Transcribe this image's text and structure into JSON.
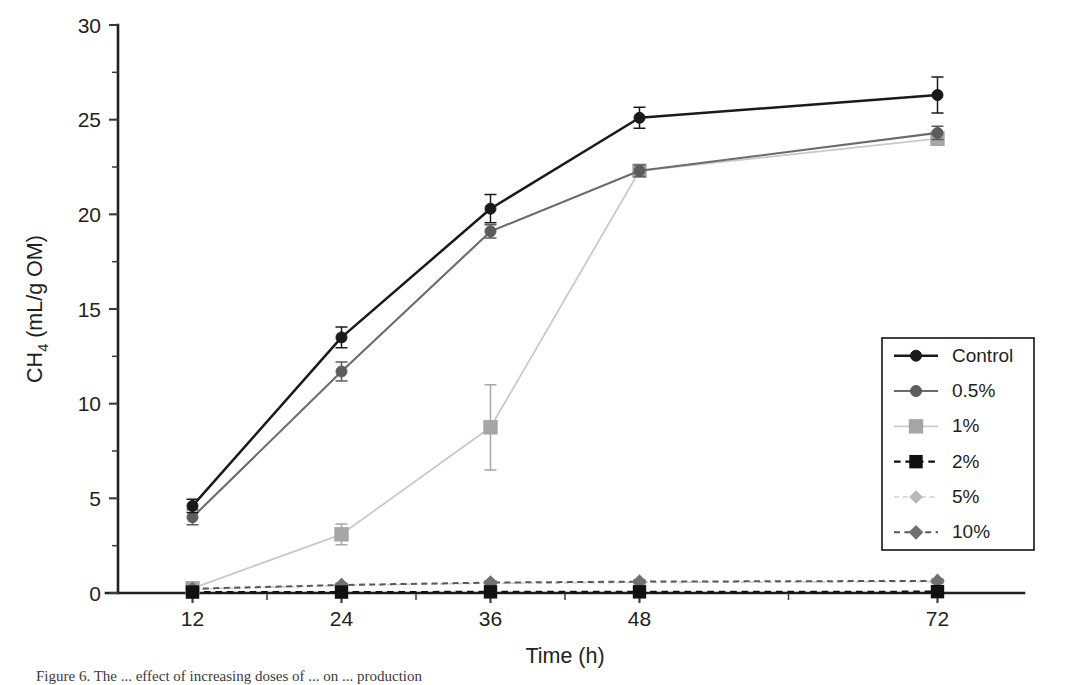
{
  "figure": {
    "caption_fragment": "Figure 6. The ... effect of increasing doses of ... on ... production",
    "background": "#ffffff",
    "ink": "#231f20"
  },
  "chart_data": {
    "type": "line",
    "title": "",
    "xlabel": "Time (h)",
    "ylabel": "CH",
    "ylabel_sub": "4",
    "ylabel_units": " (mL/g OM)",
    "x": [
      12,
      24,
      36,
      48,
      72
    ],
    "xtick_labels": [
      "12",
      "24",
      "36",
      "48",
      "72"
    ],
    "xtick_values": [
      12,
      24,
      36,
      48,
      72
    ],
    "x_minor_ticks": [
      18,
      30,
      42,
      60
    ],
    "xlim": [
      6,
      78
    ],
    "ytick_labels": [
      "0",
      "5",
      "10",
      "15",
      "20",
      "25",
      "30"
    ],
    "ytick_values": [
      0,
      5,
      10,
      15,
      20,
      25,
      30
    ],
    "y_minor_ticks": [
      2.5,
      7.5,
      12.5,
      17.5,
      22.5,
      27.5
    ],
    "ylim": [
      0,
      30
    ],
    "grid": false,
    "legend_position": "right-middle",
    "series": [
      {
        "name": "Control",
        "values": [
          4.6,
          13.5,
          20.3,
          25.1,
          26.3
        ],
        "errors": [
          0.35,
          0.55,
          0.75,
          0.55,
          0.95
        ],
        "color": "#1a1a1a",
        "line_color": "#1a1a1a",
        "line_style": "solid",
        "line_width": 2.5,
        "marker": "circle",
        "marker_size": 11
      },
      {
        "name": "0.5%",
        "values": [
          4.0,
          11.7,
          19.1,
          22.3,
          24.3
        ],
        "errors": [
          0.4,
          0.5,
          0.35,
          0.3,
          0.35
        ],
        "color": "#5d5d5d",
        "line_color": "#6b6b6b",
        "line_style": "solid",
        "line_width": 2.1,
        "marker": "circle",
        "marker_size": 11
      },
      {
        "name": "1%",
        "values": [
          0.25,
          3.1,
          8.75,
          22.3,
          24.0
        ],
        "errors": [
          0.15,
          0.55,
          2.25,
          0.3,
          0.35
        ],
        "color": "#a6a6a6",
        "line_color": "#c9c9c9",
        "line_style": "solid",
        "line_width": 1.8,
        "marker": "square",
        "marker_size": 13
      },
      {
        "name": "2%",
        "values": [
          0.05,
          0.05,
          0.06,
          0.06,
          0.07
        ],
        "errors": [
          0.03,
          0.03,
          0.03,
          0.03,
          0.03
        ],
        "color": "#111111",
        "line_color": "#111111",
        "line_style": "dashed",
        "line_width": 2.2,
        "marker": "square",
        "marker_size": 12
      },
      {
        "name": "5%",
        "values": [
          0.2,
          0.4,
          0.52,
          0.56,
          0.6
        ],
        "errors": [
          0.08,
          0.1,
          0.1,
          0.1,
          0.1
        ],
        "color": "#b9b9b9",
        "line_color": "#cfcfcf",
        "line_style": "dashed",
        "line_width": 1.7,
        "marker": "diamond",
        "marker_size": 12
      },
      {
        "name": "10%",
        "values": [
          0.22,
          0.42,
          0.55,
          0.6,
          0.64
        ],
        "errors": [
          0.08,
          0.1,
          0.1,
          0.1,
          0.1
        ],
        "color": "#707070",
        "line_color": "#585858",
        "line_style": "dashed",
        "line_width": 2.0,
        "marker": "diamond",
        "marker_size": 13
      }
    ]
  }
}
